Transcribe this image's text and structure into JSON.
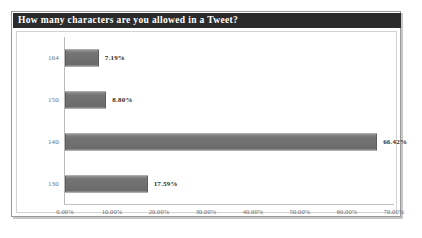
{
  "chart_data": {
    "type": "bar",
    "orientation": "horizontal",
    "title": "How many characters are you allowed in a Tweet?",
    "categories": [
      "164",
      "150",
      "140",
      "130"
    ],
    "values": [
      7.19,
      8.8,
      66.42,
      17.59
    ],
    "value_labels": [
      "7.19%",
      "8.80%",
      "66.42%",
      "17.59%"
    ],
    "xlabel": "",
    "ylabel": "",
    "xlim": [
      0,
      70
    ],
    "x_tick_labels": [
      "0.00%",
      "10.00%",
      "20.00%",
      "30.00%",
      "40.00%",
      "50.00%",
      "60.00%",
      "70.00%"
    ],
    "x_ticks": [
      0,
      10,
      20,
      30,
      40,
      50,
      60,
      70
    ],
    "grid": false,
    "legend": "none",
    "colors": {
      "title_bar_background": "#2b2b2b",
      "title_text": "#ffffff",
      "bar_fill": "#6e6e6e",
      "bar_border": "#5d5d5d",
      "axis_line": "#bdbdbd",
      "tick_text": "#6d6d6d",
      "value_text": "#2e2e2e",
      "card_background": "#ffffff",
      "card_border": "#9a9a9a"
    }
  }
}
